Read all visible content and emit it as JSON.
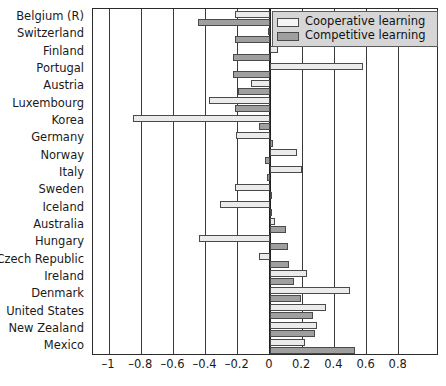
{
  "chart_data": {
    "type": "bar",
    "orientation": "horizontal",
    "title": "",
    "xlabel": "",
    "ylabel": "",
    "xlim": [
      -1.1,
      1.05
    ],
    "grid": true,
    "legend_position": "top-right",
    "xticks": [
      -1,
      -0.8,
      -0.6,
      -0.4,
      -0.2,
      0,
      0.2,
      0.4,
      0.6,
      0.8
    ],
    "xtick_labels": [
      "–1",
      "–0.8",
      "–0.6",
      "–0.4",
      "–0.2",
      "0",
      "0.2",
      "0.4",
      "0.6",
      "0.8"
    ],
    "categories": [
      "Belgium (R)",
      "Switzerland",
      "Finland",
      "Portugal",
      "Austria",
      "Luxembourg",
      "Korea",
      "Germany",
      "Norway",
      "Italy",
      "Sweden",
      "Iceland",
      "Australia",
      "Hungary",
      "Czech Republic",
      "Ireland",
      "Denmark",
      "United States",
      "New Zealand",
      "Mexico"
    ],
    "series": [
      {
        "name": "Cooperative learning",
        "color": "#ebebeb",
        "values": [
          -0.22,
          -0.01,
          0.05,
          0.58,
          -0.12,
          -0.38,
          -0.85,
          -0.21,
          0.17,
          0.2,
          -0.22,
          -0.31,
          0.03,
          -0.44,
          -0.07,
          0.23,
          0.5,
          0.35,
          0.29,
          0.22
        ]
      },
      {
        "name": "Competitive learning",
        "color": "#9f9f9f",
        "values": [
          -0.45,
          -0.22,
          -0.23,
          -0.23,
          -0.2,
          -0.22,
          -0.07,
          0.02,
          -0.03,
          -0.02,
          0.01,
          0.01,
          0.1,
          0.11,
          0.12,
          0.15,
          0.19,
          0.27,
          0.28,
          0.53
        ]
      }
    ]
  },
  "legend": {
    "items": [
      {
        "label": "Cooperative learning",
        "swatch": "light-gray-swatch"
      },
      {
        "label": "Competitive learning",
        "swatch": "dark-gray-swatch"
      }
    ]
  }
}
